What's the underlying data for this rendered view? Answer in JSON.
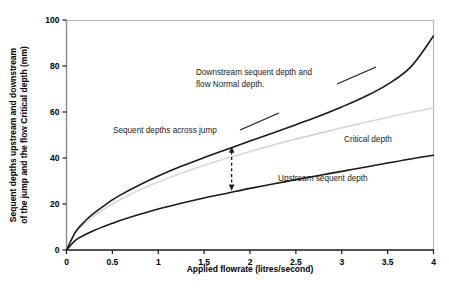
{
  "chart_data": {
    "type": "line",
    "title": "",
    "xlabel": "Applied flowrate (litres/second)",
    "ylabel": "Sequent depths upstream and downstream of the jump and the flow Critical depth (mm)",
    "ylabel_line1": "Sequent depths upstream and downstream",
    "ylabel_line2": "of the jump and the flow Critical depth (mm)",
    "xlim": [
      0,
      4
    ],
    "ylim": [
      0,
      100
    ],
    "grid": false,
    "legend_position": "inline-annotations",
    "xticks": [
      "0",
      "0.5",
      "1",
      "1.5",
      "2",
      "2.5",
      "3",
      "3.5",
      "4"
    ],
    "xtick_values": [
      0,
      0.5,
      1,
      1.5,
      2,
      2.5,
      3,
      3.5,
      4
    ],
    "yticks": [
      "0",
      "20",
      "40",
      "60",
      "80",
      "100"
    ],
    "ytick_values": [
      0,
      20,
      40,
      60,
      80,
      100
    ],
    "x": [
      0,
      0.1,
      0.2,
      0.3,
      0.4,
      0.5,
      0.6,
      0.8,
      1.0,
      1.25,
      1.5,
      1.75,
      2.0,
      2.25,
      2.5,
      2.75,
      3.0,
      3.25,
      3.5,
      3.75,
      4.0
    ],
    "series": [
      {
        "name": "Downstream sequent depth and flow Normal depth.",
        "color": "#1a1a1a",
        "width": 1.6,
        "values": [
          0,
          8.0,
          12.5,
          16.0,
          19.0,
          21.8,
          24.2,
          28.4,
          32.2,
          36.4,
          40.2,
          43.8,
          47.4,
          50.9,
          54.5,
          58.2,
          62.2,
          66.6,
          72.0,
          79.5,
          93.0
        ]
      },
      {
        "name": "Critical depth",
        "color": "#d8d8d8",
        "width": 1.6,
        "values": [
          0,
          7.5,
          11.5,
          14.8,
          17.6,
          20.0,
          22.2,
          26.2,
          29.6,
          33.4,
          36.8,
          39.9,
          42.8,
          45.6,
          48.2,
          50.7,
          53.1,
          55.4,
          57.7,
          59.8,
          61.8
        ]
      },
      {
        "name": "Upstream sequent depth",
        "color": "#1a1a1a",
        "width": 1.6,
        "values": [
          0,
          4.3,
          6.6,
          8.5,
          10.1,
          11.6,
          13.0,
          15.5,
          17.8,
          20.3,
          22.6,
          24.7,
          26.8,
          28.7,
          30.6,
          32.4,
          34.2,
          36.0,
          37.8,
          39.6,
          41.2
        ]
      }
    ],
    "annotations": [
      {
        "id": "downstream-label",
        "line1": "Downstream sequent depth and",
        "line2": "flow Normal depth."
      },
      {
        "id": "sequent-across-jump-label",
        "text": "Sequent depths across jump"
      },
      {
        "id": "critical-depth-label",
        "text": "Critical depth"
      },
      {
        "id": "upstream-label",
        "text": "Upstream sequent depth"
      }
    ],
    "arrow": {
      "id": "sequent-depth-span-arrow",
      "style": "dashed double-headed vertical",
      "x": 1.8,
      "y_top": 45.0,
      "y_bottom": 25.8,
      "color": "#1a1a1a"
    },
    "colors": {
      "axis": "#888888",
      "curve_dark": "#1a1a1a",
      "curve_light": "#d8d8d8",
      "text": "#000000",
      "background": "#ffffff"
    }
  }
}
